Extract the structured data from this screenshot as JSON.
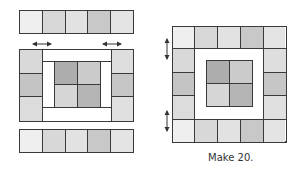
{
  "caption": "Make 20.",
  "colors": {
    "outline": "#3a3a3a",
    "background": "#ffffff",
    "white_border": "#ffffff"
  },
  "strip_colors": [
    "#efefef",
    "#d8d8d8",
    "#e2e2e2",
    "#c8c8c8",
    "#e4e4e4"
  ],
  "side_colors_left": [
    "#d9d9d9",
    "#c4c4c4",
    "#dcdcdc"
  ],
  "side_colors_right": [
    "#dedede",
    "#c6c6c6",
    "#e0e0e0"
  ],
  "center_colors": [
    "#adadad",
    "#cbcbcb",
    "#d6d6d6",
    "#b5b5b5"
  ],
  "arrows": {
    "horizontal_pressing": "left-right arrows above side columns indicating seam pressing",
    "vertical_pressing": "up-down arrows left of the assembled block indicating seam pressing"
  }
}
